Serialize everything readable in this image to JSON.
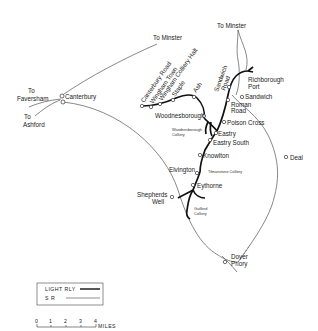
{
  "map": {
    "title": "East Kent Light Railway",
    "stations_light_railway": [
      {
        "name": "Canterbury Road"
      },
      {
        "name": "Wingham Town"
      },
      {
        "name": "Wingham Colliery Halt"
      },
      {
        "name": "Staple"
      },
      {
        "name": "Ash"
      },
      {
        "name": "Woodnesborough"
      },
      {
        "name": "Sandwich Road"
      },
      {
        "name": "Roman Road"
      },
      {
        "name": "Poison Cross"
      },
      {
        "name": "Eastry"
      },
      {
        "name": "Eastry South"
      },
      {
        "name": "Knowlton"
      },
      {
        "name": "Elvington"
      },
      {
        "name": "Eythorne"
      },
      {
        "name": "Shepherds Well"
      },
      {
        "name": "Richborough Port"
      }
    ],
    "stations_sr": [
      {
        "name": "Canterbury"
      },
      {
        "name": "Sandwich"
      },
      {
        "name": "Deal"
      },
      {
        "name": "Dover Priory"
      }
    ],
    "collieries": [
      {
        "name": "Woodnesborough Colliery",
        "line1": "Woodnesborough",
        "line2": "Colliery"
      },
      {
        "name": "Tilmanstone Colliery"
      },
      {
        "name": "Guilford Colliery",
        "line1": "Guilford",
        "line2": "Colliery"
      }
    ],
    "destinations": {
      "minster_top": "To Minster",
      "minster_left": "To Minster",
      "faversham_1": "To",
      "faversham_2": "Faversham",
      "ashford_1": "To",
      "ashford_2": "Ashford"
    },
    "labels": {
      "richborough_1": "Richborough",
      "richborough_2": "Port",
      "sandwich_road_1": "Sandwich",
      "sandwich_road_2": "Road",
      "roman_road_1": "Roman",
      "roman_road_2": "Road",
      "dover_1": "Dover",
      "dover_2": "Priory",
      "shepherds_1": "Shepherds",
      "shepherds_2": "Well"
    },
    "legend": {
      "items": [
        {
          "label": "LIGHT RLY",
          "style": "thick"
        },
        {
          "label": "S R",
          "style": "thin"
        }
      ]
    },
    "scale": {
      "ticks": [
        "0",
        "1",
        "2",
        "3",
        "4"
      ],
      "unit": "MILES"
    }
  }
}
